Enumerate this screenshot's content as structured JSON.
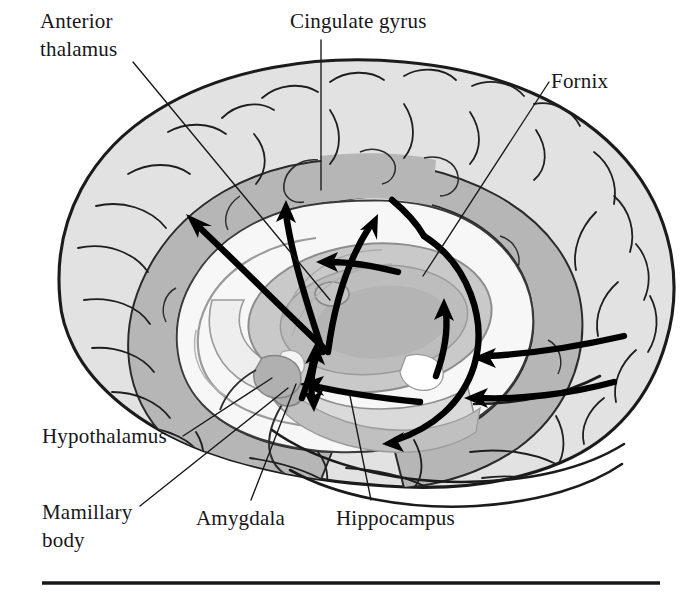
{
  "figure": {
    "kind": "anatomical-diagram",
    "background_color": "#ffffff",
    "ink_color": "#17161a"
  },
  "labels": [
    {
      "id": "anterior-thalamus",
      "text_line1": "Anterior",
      "text_line2": "thalamus",
      "x": 40,
      "y": 28,
      "leader": true
    },
    {
      "id": "cingulate-gyrus",
      "text": "Cingulate gyrus",
      "x": 290,
      "y": 28,
      "leader": true
    },
    {
      "id": "fornix",
      "text": "Fornix",
      "x": 551,
      "y": 88,
      "leader": true
    },
    {
      "id": "hypothalamus",
      "text": "Hypothalamus",
      "x": 42,
      "y": 443,
      "leader": true
    },
    {
      "id": "mamillary-body",
      "text_line1": "Mamillary",
      "text_line2": "body",
      "x": 42,
      "y": 519,
      "leader": true
    },
    {
      "id": "amygdala",
      "text": "Amygdala",
      "x": 196,
      "y": 525,
      "leader": true
    },
    {
      "id": "hippocampus",
      "text": "Hippocampus",
      "x": 336,
      "y": 525,
      "leader": true
    }
  ],
  "structures": [
    {
      "id": "cerebral-cortex",
      "name": "Cerebral cortex",
      "fill": "#e2e2e2"
    },
    {
      "id": "cingulate-band",
      "name": "Cingulate gyrus band",
      "fill": "#b6b6b6"
    },
    {
      "id": "corpus-callosum",
      "name": "Corpus callosum / white matter",
      "fill": "#f7f7f7"
    },
    {
      "id": "thalamus",
      "name": "Thalamus",
      "fill": "#c9c9c9"
    },
    {
      "id": "thalamus-inner",
      "name": "Thalamus inner nucleus",
      "fill": "#b4b4b4"
    },
    {
      "id": "mamillary-body-nub",
      "name": "Mamillary body",
      "fill": "#aeaeae"
    },
    {
      "id": "amygdala-mass",
      "name": "Amygdala",
      "fill": "#b0b0b0"
    },
    {
      "id": "hippocampus-band",
      "name": "Hippocampus",
      "fill": "#c0c0c0"
    },
    {
      "id": "brainstem",
      "name": "Brainstem / midbrain",
      "fill": "#d6d6d6"
    }
  ],
  "pathway_arrows": [
    {
      "id": "thalamus-to-cingulate-anterior",
      "description": "Thalamus to anterior cingulate, vertical upward"
    },
    {
      "id": "thalamus-to-cingulate-posterior",
      "description": "Thalamus to posterior cingulate, upward right"
    },
    {
      "id": "thalamus-to-frontal",
      "description": "Thalamus sweeping up and left to frontal cingulate"
    },
    {
      "id": "fornix-body-leftward",
      "description": "Leftward arrow along body of fornix under corpus callosum"
    },
    {
      "id": "fornix-arch-descending",
      "description": "Fornix arch curving over and down toward hippocampus"
    },
    {
      "id": "fornix-column-to-mamillary",
      "description": "Fornix column descending to mamillary body"
    },
    {
      "id": "mamillothalamic-tract",
      "description": "Mamillary body up to anterior thalamus"
    },
    {
      "id": "hippocampus-outflow",
      "description": "Hippocampus along the temporal horn, leftward"
    },
    {
      "id": "parahippocampal-upper",
      "description": "Posterior cortex inflow, upper leftward arrow"
    },
    {
      "id": "parahippocampal-lower",
      "description": "Posterior cortex inflow, lower leftward arrow"
    }
  ],
  "rule": {
    "id": "bottom-rule",
    "x1": 42,
    "y1": 583,
    "x2": 660,
    "y2": 583
  }
}
